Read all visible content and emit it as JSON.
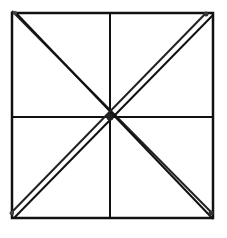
{
  "diagram": {
    "background": "#ffffff",
    "stroke_color": "#111111",
    "dot_color": "#333333",
    "square": {
      "x1": 12,
      "y1": 13,
      "x2": 213,
      "y2": 218
    },
    "center": {
      "x": 110,
      "y": 117
    },
    "elements": [
      "outer-square",
      "vertical-midline",
      "horizontal-midline",
      "diagonal-top-left-to-bottom-right (double line)",
      "diagonal-top-right-to-bottom-left (double line)",
      "vertex-dots at center and corners"
    ]
  }
}
